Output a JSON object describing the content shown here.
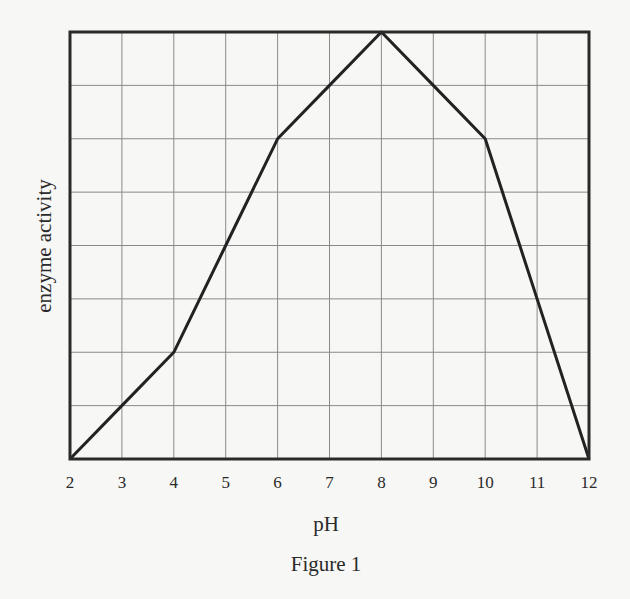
{
  "chart_data": {
    "type": "line",
    "title": "",
    "caption": "Figure 1",
    "xlabel": "pH",
    "ylabel": "enzyme activity",
    "x": [
      2,
      3,
      4,
      5,
      6,
      7,
      8,
      9,
      10,
      11,
      12
    ],
    "series": [
      {
        "name": "enzyme activity",
        "values": [
          0,
          1,
          2,
          4,
          6,
          7,
          8,
          7,
          6,
          3,
          0
        ]
      }
    ],
    "x_ticks": [
      "2",
      "3",
      "4",
      "5",
      "6",
      "7",
      "8",
      "9",
      "10",
      "11",
      "12"
    ],
    "y_ticks": [],
    "xlim": [
      2,
      12
    ],
    "ylim": [
      0,
      8
    ],
    "grid": true,
    "grid_rows": 8,
    "grid_cols": 10,
    "legend": "none",
    "line_color": "#222222",
    "grid_color": "#8a8a8a",
    "frame_color": "#2a2a2a"
  }
}
